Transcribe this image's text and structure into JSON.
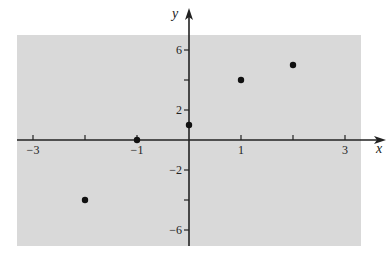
{
  "chart_data": {
    "type": "scatter",
    "title": "",
    "xlabel": "x",
    "ylabel": "y",
    "xlim": [
      -3.3,
      3.3
    ],
    "ylim": [
      -7,
      7
    ],
    "grid": false,
    "legend": null,
    "x_ticks": [
      -3,
      -2,
      -1,
      0,
      1,
      2,
      3
    ],
    "x_tick_labels": [
      "−3",
      "",
      "−1",
      "",
      "1",
      "",
      "3"
    ],
    "y_ticks": [
      -6,
      -4,
      -2,
      0,
      2,
      4,
      6
    ],
    "y_tick_labels": [
      "−6",
      "",
      "−2",
      "",
      "2",
      "",
      "6"
    ],
    "series": [
      {
        "name": "points",
        "x": [
          -2,
          -1,
          0,
          1,
          2
        ],
        "y": [
          -4,
          0,
          1,
          4,
          5
        ]
      }
    ],
    "colors": {
      "background_region": "#d9d9d9",
      "axis": "#222222",
      "points": "#111111"
    }
  }
}
